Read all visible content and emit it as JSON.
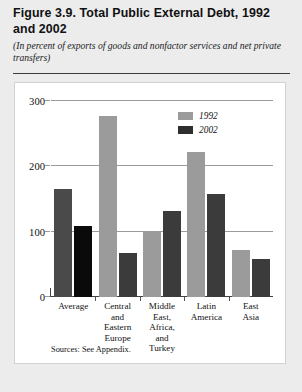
{
  "header": {
    "title": "Figure 3.9. Total Public External Debt, 1992 and 2002",
    "subtitle": "(In percent of exports of goods and nonfactor services and net private transfers)"
  },
  "source_note": "Sources: See Appendix.",
  "chart_data": {
    "type": "bar",
    "title": "Figure 3.9. Total Public External Debt, 1992 and 2002",
    "subtitle": "(In percent of exports of goods and nonfactor services and net private transfers)",
    "xlabel": "",
    "ylabel": "",
    "ylim": [
      0,
      300
    ],
    "yticks": [
      0,
      100,
      200,
      300
    ],
    "ytick_labels": [
      "0",
      "100",
      "200",
      "300"
    ],
    "grid": true,
    "legend_position": "top-right",
    "categories": [
      "Average",
      "Central and Eastern Europe",
      "Middle East, Africa, and Turkey",
      "Latin America",
      "East Asia"
    ],
    "category_lines": [
      [
        "Average"
      ],
      [
        "Central",
        "and",
        "Eastern",
        "Europe"
      ],
      [
        "Middle",
        "East,",
        "Africa,",
        "and",
        "Turkey"
      ],
      [
        "Latin",
        "America"
      ],
      [
        "East",
        "Asia"
      ]
    ],
    "series": [
      {
        "name": "1992",
        "color": "#9b9b9b",
        "values": [
          165,
          277,
          100,
          222,
          72
        ]
      },
      {
        "name": "2002",
        "color": "#2e2e2e",
        "values": [
          108,
          68,
          131,
          157,
          58
        ]
      }
    ]
  }
}
